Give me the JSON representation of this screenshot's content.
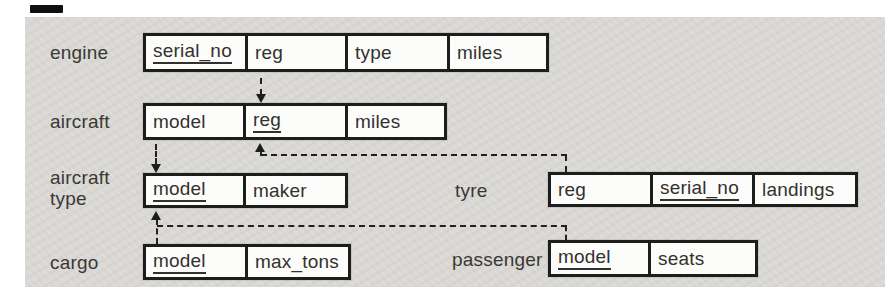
{
  "tables": {
    "engine": {
      "label": "engine",
      "fields": [
        {
          "name": "serial_no",
          "key": true
        },
        {
          "name": "reg",
          "key": false
        },
        {
          "name": "type",
          "key": false
        },
        {
          "name": "miles",
          "key": false
        }
      ]
    },
    "aircraft": {
      "label": "aircraft",
      "fields": [
        {
          "name": "model",
          "key": false
        },
        {
          "name": "reg",
          "key": true
        },
        {
          "name": "miles",
          "key": false
        }
      ]
    },
    "aircraft_type": {
      "label_line1": "aircraft",
      "label_line2": "type",
      "fields": [
        {
          "name": "model",
          "key": true
        },
        {
          "name": "maker",
          "key": false
        }
      ]
    },
    "tyre": {
      "label": "tyre",
      "fields": [
        {
          "name": "reg",
          "key": false
        },
        {
          "name": "serial_no",
          "key": true
        },
        {
          "name": "landings",
          "key": false
        }
      ]
    },
    "cargo": {
      "label": "cargo",
      "fields": [
        {
          "name": "model",
          "key": true
        },
        {
          "name": "max_tons",
          "key": false
        }
      ]
    },
    "passenger": {
      "label": "passenger",
      "fields": [
        {
          "name": "model",
          "key": true
        },
        {
          "name": "seats",
          "key": false
        }
      ]
    }
  },
  "relations": [
    {
      "from": "engine.reg",
      "to": "aircraft.reg",
      "style": "dashed-arrow"
    },
    {
      "from": "aircraft.model",
      "to": "aircraft_type.model",
      "style": "dashed-arrow"
    },
    {
      "from": "tyre.reg",
      "to": "aircraft.reg",
      "style": "dashed-arrow"
    },
    {
      "from": "cargo.model",
      "to": "aircraft_type.model",
      "style": "dashed-arrow"
    },
    {
      "from": "passenger.model",
      "to": "aircraft_type.model",
      "style": "dashed-arrow"
    }
  ],
  "colors": {
    "panel_bg": "#d9d8d4",
    "line": "#1d1d1b",
    "cell_bg": "#fcfcfa",
    "text": "#33312e"
  }
}
